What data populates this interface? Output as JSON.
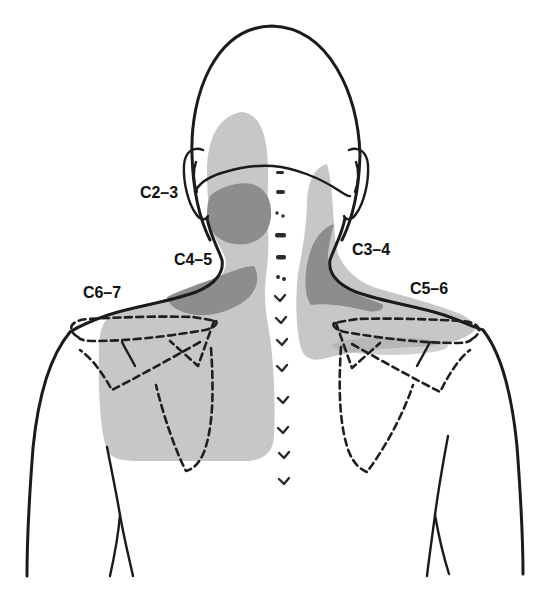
{
  "figure": {
    "kind": "cervical-facet-pain-referral-map",
    "view": "posterior head, neck and shoulders outline with shaded referral zones",
    "labels": {
      "c2_3": "C2–3",
      "c3_4": "C3–4",
      "c4_5": "C4–5",
      "c5_6": "C5–6",
      "c6_7": "C6–7"
    },
    "regions": [
      {
        "label": "C2–3",
        "shade": "dark"
      },
      {
        "label": "C3–4",
        "shade": "dark"
      },
      {
        "label": "C4–5",
        "shade": "dark"
      },
      {
        "label": "C5–6",
        "shade": "light"
      },
      {
        "label": "C6–7",
        "shade": "light"
      }
    ],
    "colors": {
      "light_region": "#c7c7c7",
      "medium_region": "#a9a9a9",
      "dark_region": "#8d8d8d",
      "outline": "#1b1b1b",
      "label_text": "#111111",
      "background": "#ffffff"
    }
  }
}
